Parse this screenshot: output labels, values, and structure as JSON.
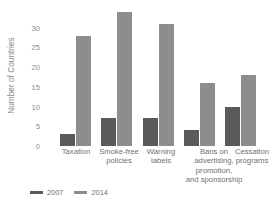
{
  "chart_data": {
    "type": "bar",
    "title": "",
    "xlabel": "",
    "ylabel": "Number of Countries",
    "categories": [
      "Taxation",
      "Smoke-free\npolicies",
      "Warning\nlabels",
      "Bans on\nadvertising,\npromotion,\nand sponsorship",
      "Cessation\nprograms"
    ],
    "series": [
      {
        "name": "2007",
        "color": "#5a5a5a",
        "values": [
          3,
          7,
          7,
          4,
          10
        ]
      },
      {
        "name": "2014",
        "color": "#8d8d8d",
        "values": [
          28,
          34,
          31,
          16,
          18
        ]
      }
    ],
    "ylim": [
      0,
      34
    ],
    "yticks": [
      0,
      5,
      10,
      15,
      20,
      25,
      30
    ],
    "ytick_labels": [
      "0",
      "5",
      "10",
      "15",
      "20",
      "25",
      "30"
    ],
    "grid": false,
    "legend_position": "bottom-left"
  }
}
